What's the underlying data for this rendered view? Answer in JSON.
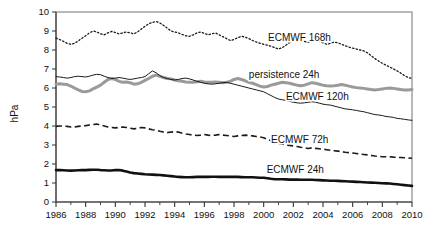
{
  "chart_data": {
    "type": "line",
    "title": "",
    "xlabel": "",
    "ylabel": "hPa",
    "xlim": [
      1986,
      2010
    ],
    "ylim": [
      0,
      10
    ],
    "grid": false,
    "legend_position": "inline-annotations",
    "y_ticks": [
      "0",
      "1",
      "2",
      "3",
      "4",
      "5",
      "6",
      "7",
      "8",
      "9",
      "10"
    ],
    "x_ticks": [
      "1986",
      "1988",
      "1990",
      "1992",
      "1994",
      "1996",
      "1998",
      "2000",
      "2002",
      "2004",
      "2006",
      "2008",
      "2010"
    ],
    "x_minor_step": 1,
    "x": [
      1986.0,
      1986.25,
      1986.5,
      1986.75,
      1987.0,
      1987.25,
      1987.5,
      1987.75,
      1988.0,
      1988.25,
      1988.5,
      1988.75,
      1989.0,
      1989.25,
      1989.5,
      1989.75,
      1990.0,
      1990.25,
      1990.5,
      1990.75,
      1991.0,
      1991.25,
      1991.5,
      1991.75,
      1992.0,
      1992.25,
      1992.5,
      1992.75,
      1993.0,
      1993.25,
      1993.5,
      1993.75,
      1994.0,
      1994.25,
      1994.5,
      1994.75,
      1995.0,
      1995.25,
      1995.5,
      1995.75,
      1996.0,
      1996.25,
      1996.5,
      1996.75,
      1997.0,
      1997.25,
      1997.5,
      1997.75,
      1998.0,
      1998.25,
      1998.5,
      1998.75,
      1999.0,
      1999.25,
      1999.5,
      1999.75,
      2000.0,
      2000.25,
      2000.5,
      2000.75,
      2001.0,
      2001.25,
      2001.5,
      2001.75,
      2002.0,
      2002.25,
      2002.5,
      2002.75,
      2003.0,
      2003.25,
      2003.5,
      2003.75,
      2004.0,
      2004.25,
      2004.5,
      2004.75,
      2005.0,
      2005.25,
      2005.5,
      2005.75,
      2006.0,
      2006.25,
      2006.5,
      2006.75,
      2007.0,
      2007.25,
      2007.5,
      2007.75,
      2008.0,
      2008.25,
      2008.5,
      2008.75,
      2009.0,
      2009.25,
      2009.5,
      2009.75,
      2010.0
    ],
    "series": [
      {
        "name": "ECMWF 168h",
        "style": "dotted",
        "color": "#1a1a1a",
        "width": 1.3,
        "label_x": 2000.3,
        "label_y": 8.45,
        "values": [
          8.62,
          8.55,
          8.45,
          8.35,
          8.3,
          8.35,
          8.48,
          8.62,
          8.75,
          8.9,
          9.0,
          8.95,
          8.85,
          8.8,
          8.9,
          8.98,
          8.92,
          8.85,
          8.9,
          8.95,
          8.9,
          8.85,
          8.95,
          9.1,
          9.25,
          9.38,
          9.45,
          9.5,
          9.42,
          9.3,
          9.15,
          9.0,
          8.95,
          8.9,
          8.82,
          8.75,
          8.72,
          8.8,
          8.9,
          8.95,
          8.88,
          8.8,
          8.85,
          8.9,
          8.8,
          8.7,
          8.6,
          8.5,
          8.55,
          8.65,
          8.72,
          8.68,
          8.6,
          8.5,
          8.42,
          8.35,
          8.3,
          8.25,
          8.2,
          8.12,
          8.05,
          8.12,
          8.25,
          8.4,
          8.55,
          8.62,
          8.55,
          8.45,
          8.4,
          8.45,
          8.5,
          8.45,
          8.38,
          8.3,
          8.35,
          8.42,
          8.38,
          8.3,
          8.22,
          8.15,
          8.1,
          8.05,
          8.0,
          7.95,
          7.85,
          7.7,
          7.55,
          7.42,
          7.3,
          7.2,
          7.1,
          7.0,
          6.9,
          6.78,
          6.65,
          6.55,
          6.5
        ]
      },
      {
        "name": "persistence 24h",
        "style": "solid",
        "color": "#9a9a9a",
        "width": 3.0,
        "label_x": 1999.0,
        "label_y": 6.55,
        "values": [
          6.2,
          6.22,
          6.2,
          6.18,
          6.1,
          6.0,
          5.9,
          5.82,
          5.8,
          5.85,
          5.95,
          6.05,
          6.15,
          6.3,
          6.45,
          6.5,
          6.45,
          6.35,
          6.3,
          6.32,
          6.28,
          6.2,
          6.22,
          6.3,
          6.4,
          6.5,
          6.62,
          6.68,
          6.62,
          6.55,
          6.5,
          6.48,
          6.42,
          6.38,
          6.35,
          6.32,
          6.3,
          6.3,
          6.33,
          6.35,
          6.32,
          6.3,
          6.3,
          6.32,
          6.3,
          6.28,
          6.3,
          6.35,
          6.45,
          6.5,
          6.45,
          6.38,
          6.3,
          6.25,
          6.18,
          6.1,
          6.05,
          6.08,
          6.15,
          6.2,
          6.25,
          6.3,
          6.28,
          6.25,
          6.2,
          6.15,
          6.12,
          6.15,
          6.22,
          6.28,
          6.25,
          6.2,
          6.15,
          6.12,
          6.1,
          6.12,
          6.15,
          6.18,
          6.15,
          6.1,
          6.05,
          6.02,
          6.0,
          5.98,
          5.95,
          5.92,
          5.9,
          5.92,
          5.95,
          5.98,
          6.0,
          5.98,
          5.95,
          5.92,
          5.9,
          5.9,
          5.92
        ]
      },
      {
        "name": "ECMWF 120h",
        "style": "solid",
        "color": "#1a1a1a",
        "width": 1.0,
        "label_x": 2001.5,
        "label_y": 5.35,
        "values": [
          6.6,
          6.58,
          6.55,
          6.52,
          6.55,
          6.6,
          6.62,
          6.6,
          6.58,
          6.62,
          6.68,
          6.72,
          6.7,
          6.62,
          6.55,
          6.5,
          6.52,
          6.55,
          6.52,
          6.48,
          6.45,
          6.48,
          6.52,
          6.55,
          6.6,
          6.75,
          6.9,
          6.8,
          6.65,
          6.55,
          6.5,
          6.45,
          6.42,
          6.45,
          6.5,
          6.52,
          6.48,
          6.42,
          6.35,
          6.3,
          6.25,
          6.22,
          6.2,
          6.22,
          6.25,
          6.28,
          6.3,
          6.25,
          6.2,
          6.15,
          6.1,
          6.05,
          6.0,
          5.95,
          5.9,
          5.85,
          5.8,
          5.7,
          5.6,
          5.5,
          5.42,
          5.38,
          5.35,
          5.3,
          5.25,
          5.22,
          5.2,
          5.22,
          5.25,
          5.28,
          5.25,
          5.2,
          5.15,
          5.12,
          5.1,
          5.05,
          5.0,
          4.95,
          4.9,
          4.88,
          4.85,
          4.82,
          4.78,
          4.75,
          4.7,
          4.65,
          4.6,
          4.58,
          4.55,
          4.5,
          4.48,
          4.45,
          4.4,
          4.38,
          4.35,
          4.32,
          4.3
        ]
      },
      {
        "name": "ECMWF 72h",
        "style": "dashed",
        "color": "#1a1a1a",
        "width": 1.6,
        "label_x": 2000.5,
        "label_y": 3.1,
        "values": [
          3.98,
          4.0,
          4.0,
          3.98,
          3.95,
          3.95,
          3.98,
          4.0,
          4.02,
          4.05,
          4.08,
          4.1,
          4.05,
          4.0,
          3.95,
          3.92,
          3.9,
          3.92,
          3.95,
          3.92,
          3.88,
          3.85,
          3.88,
          3.92,
          3.9,
          3.85,
          3.8,
          3.78,
          3.72,
          3.68,
          3.65,
          3.68,
          3.7,
          3.68,
          3.62,
          3.58,
          3.55,
          3.52,
          3.5,
          3.52,
          3.55,
          3.52,
          3.5,
          3.52,
          3.55,
          3.52,
          3.5,
          3.48,
          3.45,
          3.48,
          3.5,
          3.52,
          3.5,
          3.48,
          3.45,
          3.42,
          3.38,
          3.3,
          3.22,
          3.15,
          3.1,
          3.05,
          3.0,
          2.98,
          2.95,
          2.92,
          2.88,
          2.85,
          2.82,
          2.85,
          2.82,
          2.8,
          2.78,
          2.75,
          2.72,
          2.7,
          2.68,
          2.65,
          2.62,
          2.6,
          2.58,
          2.55,
          2.52,
          2.5,
          2.48,
          2.45,
          2.42,
          2.4,
          2.38,
          2.38,
          2.38,
          2.36,
          2.35,
          2.34,
          2.33,
          2.32,
          2.3
        ]
      },
      {
        "name": "ECMWF 24h",
        "style": "solid",
        "color": "#111111",
        "width": 2.6,
        "label_x": 2000.2,
        "label_y": 1.55,
        "values": [
          1.68,
          1.68,
          1.67,
          1.66,
          1.65,
          1.66,
          1.67,
          1.68,
          1.68,
          1.69,
          1.7,
          1.7,
          1.68,
          1.67,
          1.66,
          1.66,
          1.68,
          1.68,
          1.65,
          1.6,
          1.55,
          1.52,
          1.5,
          1.48,
          1.46,
          1.45,
          1.44,
          1.43,
          1.42,
          1.4,
          1.38,
          1.36,
          1.34,
          1.32,
          1.31,
          1.3,
          1.3,
          1.31,
          1.32,
          1.32,
          1.32,
          1.32,
          1.33,
          1.33,
          1.32,
          1.32,
          1.32,
          1.32,
          1.32,
          1.32,
          1.31,
          1.3,
          1.3,
          1.3,
          1.29,
          1.28,
          1.28,
          1.25,
          1.22,
          1.2,
          1.2,
          1.2,
          1.19,
          1.18,
          1.18,
          1.18,
          1.17,
          1.17,
          1.17,
          1.17,
          1.16,
          1.15,
          1.14,
          1.13,
          1.12,
          1.12,
          1.11,
          1.1,
          1.09,
          1.08,
          1.07,
          1.06,
          1.05,
          1.04,
          1.03,
          1.02,
          1.01,
          1.0,
          0.99,
          0.98,
          0.97,
          0.95,
          0.93,
          0.91,
          0.89,
          0.87,
          0.85
        ]
      }
    ]
  }
}
